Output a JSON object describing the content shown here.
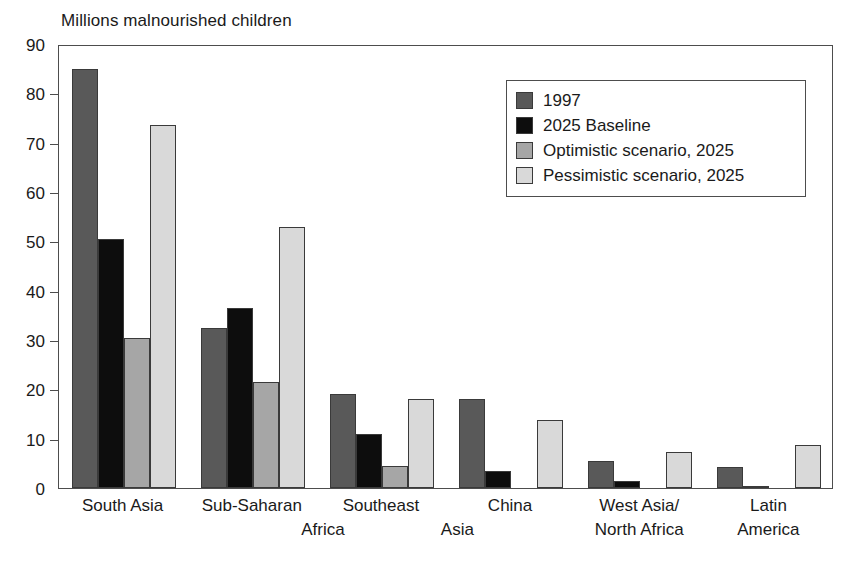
{
  "chart_data": {
    "type": "bar",
    "title": "Millions malnourished children",
    "xlabel": "",
    "ylabel": "",
    "ylim": [
      0,
      90
    ],
    "ytick_step": 10,
    "yticks": [
      0,
      10,
      20,
      30,
      40,
      50,
      60,
      70,
      80,
      90
    ],
    "grid": false,
    "legend_position": "top-right-inside",
    "categories": [
      "South Asia",
      "Sub-Saharan Africa",
      "Southeast Asia",
      "China",
      "West Asia/North Africa",
      "Latin America"
    ],
    "category_lines": [
      [
        "South Asia"
      ],
      [
        "Sub-Saharan",
        "Africa"
      ],
      [
        "Southeast",
        "Asia"
      ],
      [
        "China"
      ],
      [
        "West Asia/",
        "North Africa"
      ],
      [
        "Latin",
        "America"
      ]
    ],
    "series": [
      {
        "name": "1997",
        "color": "#595959",
        "values": [
          85.0,
          32.5,
          19.0,
          18.0,
          5.5,
          4.3
        ]
      },
      {
        "name": "2025 Baseline",
        "color": "#0d0d0d",
        "values": [
          50.5,
          36.5,
          11.0,
          3.5,
          1.5,
          0.5
        ]
      },
      {
        "name": "Optimistic scenario, 2025",
        "color": "#a6a6a6",
        "values": [
          30.5,
          21.5,
          4.5,
          0.0,
          0.0,
          0.0
        ]
      },
      {
        "name": "Pessimistic scenario, 2025",
        "color": "#d9d9d9",
        "values": [
          73.5,
          53.0,
          18.0,
          13.8,
          7.3,
          8.8
        ]
      }
    ]
  },
  "legend": {
    "items": [
      {
        "label": "1997",
        "swatch": "s0"
      },
      {
        "label": "2025 Baseline",
        "swatch": "s1"
      },
      {
        "label": "Optimistic scenario, 2025",
        "swatch": "s2"
      },
      {
        "label": "Pessimistic scenario, 2025",
        "swatch": "s3"
      }
    ]
  },
  "colors": {
    "series_1997": "#595959",
    "series_baseline": "#0d0d0d",
    "series_optimistic": "#a6a6a6",
    "series_pessimistic": "#d9d9d9",
    "axis": "#4d4d4d",
    "text": "#1a1a1a",
    "background": "#ffffff"
  }
}
